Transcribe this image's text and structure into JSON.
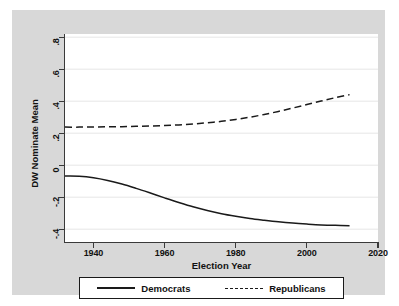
{
  "chart_data": {
    "type": "line",
    "title": "",
    "xlabel": "Election Year",
    "ylabel": "DW Nominate Mean",
    "xlim": [
      1932,
      2020
    ],
    "ylim": [
      -0.48,
      0.82
    ],
    "xticks": [
      1940,
      1960,
      1980,
      2000,
      2020
    ],
    "xticklabels": [
      "1940",
      "1960",
      "1980",
      "2000",
      "2020"
    ],
    "yticks": [
      0.8,
      0.6,
      0.4,
      0.2,
      0,
      -0.2,
      -0.4
    ],
    "yticklabels": [
      ".8",
      ".6",
      ".4",
      ".2",
      "0",
      "-.2",
      "-.4"
    ],
    "grid": "horizontal",
    "legend_position": "below-axes",
    "x": [
      1932,
      1936,
      1940,
      1944,
      1948,
      1952,
      1956,
      1960,
      1964,
      1968,
      1972,
      1976,
      1980,
      1984,
      1988,
      1992,
      1996,
      2000,
      2004,
      2008,
      2012
    ],
    "series": [
      {
        "name": "Democrats",
        "linestyle": "solid",
        "color": "#1a1a1a",
        "values": [
          -0.068,
          -0.069,
          -0.078,
          -0.095,
          -0.118,
          -0.145,
          -0.174,
          -0.204,
          -0.233,
          -0.26,
          -0.283,
          -0.303,
          -0.319,
          -0.333,
          -0.344,
          -0.354,
          -0.362,
          -0.368,
          -0.373,
          -0.376,
          -0.378
        ]
      },
      {
        "name": "Republicans",
        "linestyle": "dashed",
        "color": "#1a1a1a",
        "values": [
          0.238,
          0.238,
          0.239,
          0.24,
          0.241,
          0.243,
          0.245,
          0.248,
          0.252,
          0.258,
          0.265,
          0.274,
          0.286,
          0.3,
          0.317,
          0.336,
          0.357,
          0.379,
          0.401,
          0.422,
          0.441
        ]
      }
    ]
  },
  "legend": {
    "entries": [
      {
        "label": "Democrats",
        "style": "solid"
      },
      {
        "label": "Republicans",
        "style": "dashed"
      }
    ]
  }
}
